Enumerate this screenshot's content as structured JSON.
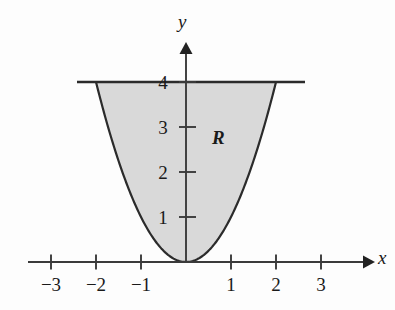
{
  "chart_data": {
    "type": "line",
    "title": "",
    "xlabel": "x",
    "ylabel": "y",
    "xlim": [
      -3.5,
      4.05
    ],
    "ylim": [
      -0.45,
      4.85
    ],
    "grid": false,
    "legend": null,
    "xticks": [
      -3,
      -2,
      -1,
      1,
      2,
      3
    ],
    "xticklabels": [
      "−3",
      "−2",
      "−1",
      "1",
      "2",
      "3"
    ],
    "yticks": [
      1,
      2,
      3,
      4
    ],
    "yticklabels": [
      "1",
      "2",
      "3",
      "4"
    ],
    "series": [
      {
        "name": "y = x^2",
        "kind": "parabola",
        "equation": "y = x²",
        "x": [
          -2,
          -1.75,
          -1.5,
          -1.25,
          -1,
          -0.75,
          -0.5,
          -0.25,
          0,
          0.25,
          0.5,
          0.75,
          1,
          1.25,
          1.5,
          1.75,
          2
        ],
        "values": [
          4,
          3.0625,
          2.25,
          1.5625,
          1,
          0.5625,
          0.25,
          0.0625,
          0,
          0.0625,
          0.25,
          0.5625,
          1,
          1.5625,
          2.25,
          3.0625,
          4
        ]
      },
      {
        "name": "y = 4",
        "kind": "horizontal-line",
        "equation": "y = 4",
        "x": [
          -2.4,
          2.65
        ],
        "values": [
          4,
          4
        ]
      }
    ],
    "shaded_region": {
      "label": "R",
      "label_position": {
        "x": 0.72,
        "y": 2.75
      },
      "fill_color": "#d9d9d9",
      "bounded_below": "y = x²",
      "bounded_above": "y = 4",
      "x_from": -2,
      "x_to": 2
    },
    "annotations": [
      {
        "text": "R",
        "x": 0.72,
        "y": 2.75,
        "style": "italic-bold-serif"
      }
    ],
    "axis_style": {
      "x_axis_arrow": true,
      "y_axis_arrow": true,
      "stroke_color": "#3a3a3a",
      "curve_color": "#2a2a2a"
    }
  },
  "labels": {
    "x_axis": "x",
    "y_axis": "y",
    "region": "R",
    "x_tick_neg3": "−3",
    "x_tick_neg2": "−2",
    "x_tick_neg1": "−1",
    "x_tick_1": "1",
    "x_tick_2": "2",
    "x_tick_3": "3",
    "y_tick_1": "1",
    "y_tick_2": "2",
    "y_tick_3": "3",
    "y_tick_4": "4"
  }
}
